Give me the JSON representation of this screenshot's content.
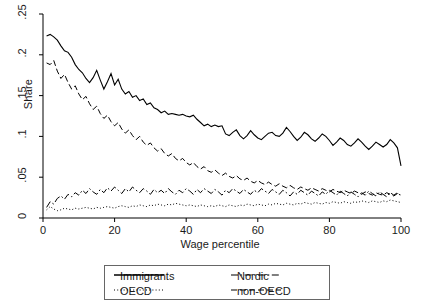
{
  "chart_data": {
    "type": "line",
    "title": "",
    "xlabel": "Wage percentile",
    "ylabel": "Share",
    "xlim": [
      0,
      100
    ],
    "ylim": [
      0,
      0.25
    ],
    "grid": false,
    "legend_position": "below-axes",
    "xticks": [
      0,
      20,
      40,
      60,
      80,
      100
    ],
    "xtick_labels": [
      "0",
      "20",
      "40",
      "60",
      "80",
      "100"
    ],
    "yticks": [
      0,
      0.05,
      0.1,
      0.15,
      0.2,
      0.25
    ],
    "ytick_labels": [
      "0",
      ".05",
      ".1",
      ".15",
      ".2",
      ".25"
    ],
    "x": [
      1,
      2,
      3,
      4,
      5,
      6,
      7,
      8,
      9,
      10,
      11,
      12,
      13,
      14,
      15,
      16,
      17,
      18,
      19,
      20,
      21,
      22,
      23,
      24,
      25,
      26,
      27,
      28,
      29,
      30,
      31,
      32,
      33,
      34,
      35,
      36,
      37,
      38,
      39,
      40,
      41,
      42,
      43,
      44,
      45,
      46,
      47,
      48,
      49,
      50,
      51,
      52,
      53,
      54,
      55,
      56,
      57,
      58,
      59,
      60,
      61,
      62,
      63,
      64,
      65,
      66,
      67,
      68,
      69,
      70,
      71,
      72,
      73,
      74,
      75,
      76,
      77,
      78,
      79,
      80,
      81,
      82,
      83,
      84,
      85,
      86,
      87,
      88,
      89,
      90,
      91,
      92,
      93,
      94,
      95,
      96,
      97,
      98,
      99,
      100
    ],
    "series": [
      {
        "name": "Immigrants",
        "style": "solid",
        "values": [
          0.223,
          0.225,
          0.222,
          0.218,
          0.211,
          0.205,
          0.203,
          0.197,
          0.188,
          0.182,
          0.178,
          0.171,
          0.166,
          0.172,
          0.181,
          0.169,
          0.158,
          0.167,
          0.177,
          0.163,
          0.17,
          0.158,
          0.152,
          0.155,
          0.148,
          0.15,
          0.144,
          0.146,
          0.139,
          0.141,
          0.135,
          0.133,
          0.129,
          0.131,
          0.127,
          0.128,
          0.127,
          0.126,
          0.127,
          0.125,
          0.124,
          0.126,
          0.121,
          0.117,
          0.113,
          0.115,
          0.112,
          0.114,
          0.112,
          0.113,
          0.103,
          0.101,
          0.105,
          0.108,
          0.101,
          0.097,
          0.101,
          0.107,
          0.102,
          0.098,
          0.096,
          0.1,
          0.104,
          0.105,
          0.101,
          0.1,
          0.104,
          0.111,
          0.106,
          0.1,
          0.095,
          0.099,
          0.105,
          0.102,
          0.097,
          0.094,
          0.098,
          0.103,
          0.1,
          0.095,
          0.089,
          0.093,
          0.098,
          0.095,
          0.09,
          0.088,
          0.092,
          0.097,
          0.093,
          0.088,
          0.084,
          0.088,
          0.093,
          0.09,
          0.087,
          0.09,
          0.096,
          0.092,
          0.086,
          0.064
        ]
      },
      {
        "name": "OECD",
        "style": "dotted",
        "values": [
          0.01,
          0.014,
          0.011,
          0.009,
          0.01,
          0.012,
          0.011,
          0.01,
          0.012,
          0.011,
          0.012,
          0.013,
          0.012,
          0.011,
          0.013,
          0.012,
          0.013,
          0.014,
          0.013,
          0.012,
          0.014,
          0.015,
          0.014,
          0.013,
          0.015,
          0.014,
          0.016,
          0.015,
          0.014,
          0.016,
          0.015,
          0.017,
          0.016,
          0.015,
          0.017,
          0.016,
          0.018,
          0.017,
          0.016,
          0.015,
          0.016,
          0.015,
          0.014,
          0.016,
          0.015,
          0.014,
          0.015,
          0.014,
          0.016,
          0.015,
          0.014,
          0.016,
          0.015,
          0.014,
          0.016,
          0.015,
          0.017,
          0.016,
          0.015,
          0.017,
          0.016,
          0.015,
          0.017,
          0.016,
          0.018,
          0.017,
          0.016,
          0.018,
          0.017,
          0.016,
          0.018,
          0.017,
          0.019,
          0.018,
          0.017,
          0.019,
          0.018,
          0.017,
          0.019,
          0.018,
          0.02,
          0.019,
          0.018,
          0.02,
          0.019,
          0.018,
          0.02,
          0.019,
          0.021,
          0.02,
          0.019,
          0.021,
          0.02,
          0.019,
          0.021,
          0.02,
          0.022,
          0.021,
          0.02,
          0.019
        ]
      },
      {
        "name": "Nordic",
        "style": "dashdot",
        "values": [
          0.013,
          0.02,
          0.017,
          0.024,
          0.027,
          0.023,
          0.029,
          0.026,
          0.031,
          0.028,
          0.034,
          0.03,
          0.036,
          0.032,
          0.029,
          0.035,
          0.031,
          0.037,
          0.033,
          0.038,
          0.034,
          0.03,
          0.036,
          0.032,
          0.038,
          0.034,
          0.031,
          0.036,
          0.033,
          0.029,
          0.035,
          0.031,
          0.034,
          0.03,
          0.036,
          0.032,
          0.029,
          0.034,
          0.031,
          0.036,
          0.033,
          0.029,
          0.035,
          0.031,
          0.036,
          0.033,
          0.03,
          0.035,
          0.032,
          0.028,
          0.034,
          0.031,
          0.036,
          0.033,
          0.03,
          0.035,
          0.032,
          0.029,
          0.034,
          0.031,
          0.036,
          0.033,
          0.03,
          0.035,
          0.032,
          0.029,
          0.034,
          0.031,
          0.027,
          0.032,
          0.029,
          0.034,
          0.031,
          0.028,
          0.033,
          0.03,
          0.027,
          0.032,
          0.029,
          0.034,
          0.031,
          0.028,
          0.033,
          0.03,
          0.027,
          0.032,
          0.029,
          0.026,
          0.031,
          0.028,
          0.033,
          0.03,
          0.027,
          0.032,
          0.029,
          0.026,
          0.031,
          0.028,
          0.031,
          0.027
        ]
      },
      {
        "name": "non-OECD",
        "style": "dashed",
        "values": [
          0.19,
          0.188,
          0.193,
          0.18,
          0.171,
          0.176,
          0.166,
          0.158,
          0.162,
          0.152,
          0.145,
          0.149,
          0.14,
          0.133,
          0.137,
          0.128,
          0.122,
          0.126,
          0.118,
          0.113,
          0.117,
          0.109,
          0.104,
          0.108,
          0.101,
          0.096,
          0.1,
          0.093,
          0.089,
          0.092,
          0.086,
          0.082,
          0.085,
          0.079,
          0.076,
          0.079,
          0.073,
          0.07,
          0.073,
          0.068,
          0.065,
          0.068,
          0.063,
          0.06,
          0.063,
          0.058,
          0.056,
          0.059,
          0.055,
          0.052,
          0.055,
          0.051,
          0.049,
          0.052,
          0.048,
          0.046,
          0.049,
          0.045,
          0.043,
          0.046,
          0.043,
          0.041,
          0.044,
          0.041,
          0.039,
          0.042,
          0.039,
          0.037,
          0.04,
          0.037,
          0.035,
          0.038,
          0.036,
          0.034,
          0.037,
          0.035,
          0.033,
          0.036,
          0.034,
          0.032,
          0.035,
          0.033,
          0.031,
          0.034,
          0.032,
          0.03,
          0.033,
          0.031,
          0.029,
          0.032,
          0.03,
          0.028,
          0.031,
          0.029,
          0.028,
          0.031,
          0.029,
          0.027,
          0.03,
          0.028
        ]
      }
    ]
  },
  "legend": {
    "entries": [
      {
        "label": "Immigrants",
        "style": "solid"
      },
      {
        "label": "Nordic",
        "style": "dashdot"
      },
      {
        "label": "OECD",
        "style": "dotted"
      },
      {
        "label": "non-OECD",
        "style": "dashed"
      }
    ]
  }
}
